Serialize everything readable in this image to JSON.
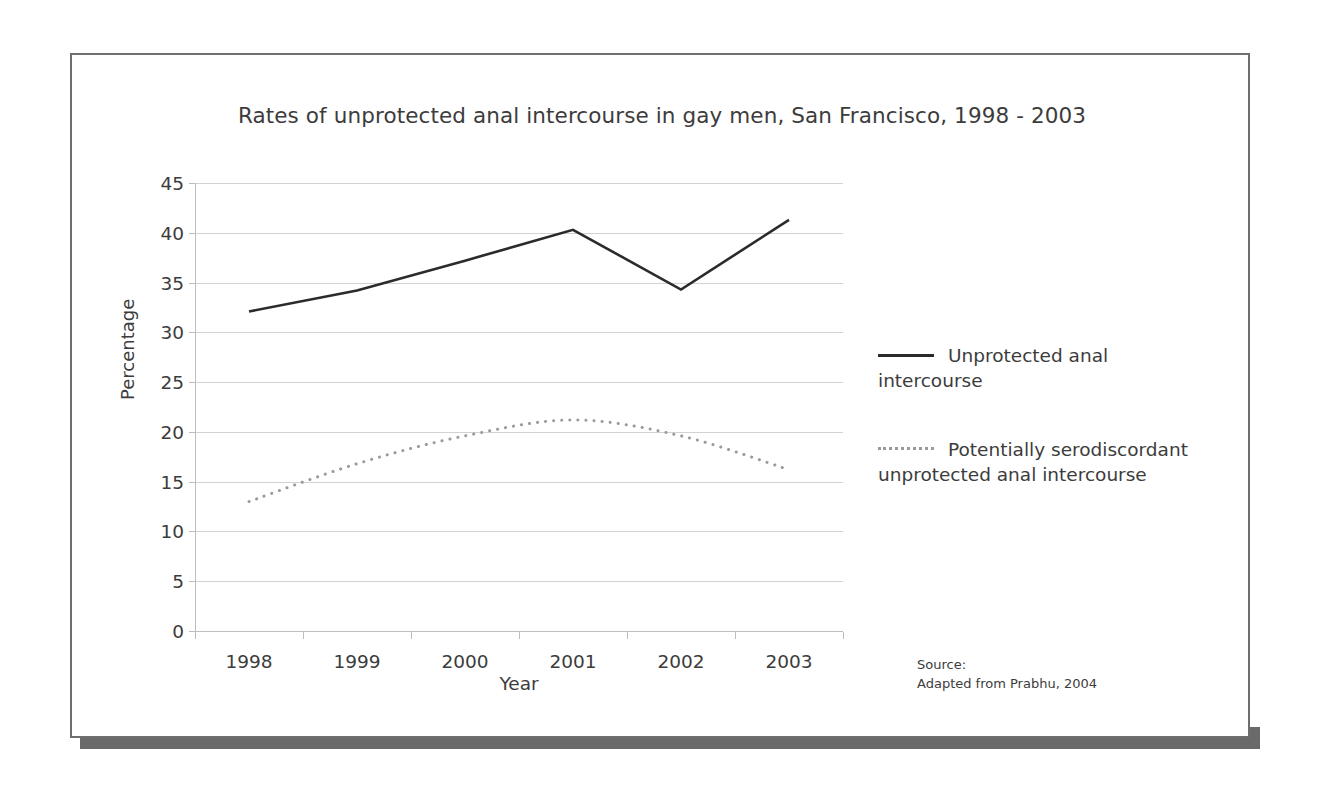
{
  "figure": {
    "title": "Rates of unprotected anal intercourse in gay men, San Francisco, 1998 - 2003",
    "source_line_1": "Source:",
    "source_line_2": "Adapted from Prabhu, 2004"
  },
  "legend": {
    "items": [
      {
        "label": "Unprotected anal intercourse",
        "style": "solid",
        "color": "#2b2b2b"
      },
      {
        "label": "Potentially serodiscordant unprotected anal intercourse",
        "style": "dotted",
        "color": "#9a9a9a"
      }
    ]
  },
  "chart_data": {
    "type": "line",
    "title": "Rates of unprotected anal intercourse in gay men, San Francisco, 1998 - 2003",
    "xlabel": "Year",
    "ylabel": "Percentage",
    "categories": [
      "1998",
      "1999",
      "2000",
      "2001",
      "2002",
      "2003"
    ],
    "yticks": [
      0,
      5,
      10,
      15,
      20,
      25,
      30,
      35,
      40,
      45
    ],
    "ytick_labels": [
      "0",
      "5",
      "10",
      "15",
      "20",
      "25",
      "30",
      "35",
      "40",
      "45"
    ],
    "ylim": [
      0,
      45
    ],
    "grid": "horizontal",
    "legend_position": "right",
    "series": [
      {
        "name": "Unprotected anal intercourse",
        "style": "solid",
        "color": "#2b2b2b",
        "smooth": false,
        "values": [
          32.1,
          34.2,
          37.2,
          40.3,
          34.3,
          41.3
        ]
      },
      {
        "name": "Potentially serodiscordant unprotected anal intercourse",
        "style": "dotted",
        "color": "#9a9a9a",
        "smooth": true,
        "values": [
          13.0,
          16.8,
          19.6,
          21.2,
          19.6,
          16.2
        ]
      }
    ]
  }
}
